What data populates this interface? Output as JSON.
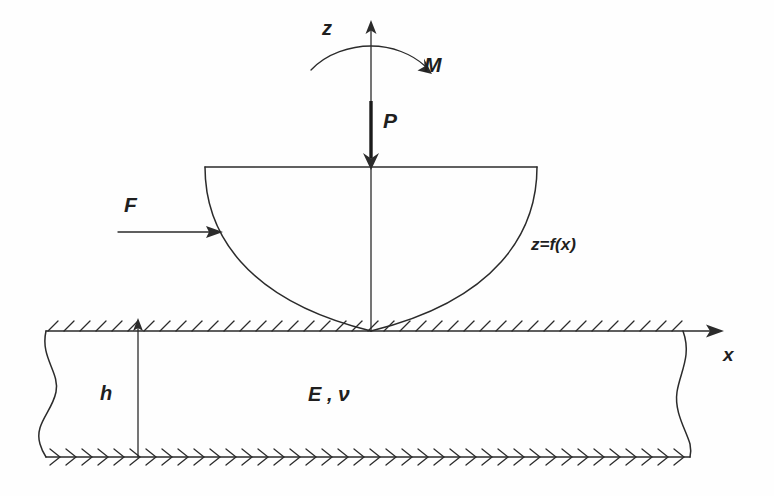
{
  "figure": {
    "background_color": "#fefefe",
    "line_color": "#2b2b2b",
    "labels": {
      "axis_z": "z",
      "axis_x": "x",
      "moment": "M",
      "normal_load": "P",
      "tangential_load": "F",
      "profile": "z=f(x)",
      "layer_thickness": "h",
      "material_properties_modulus": "E",
      "material_properties_separator": " , ",
      "material_properties_poisson": "ν"
    },
    "icons": {
      "z_axis_arrow": "arrow-up-icon",
      "x_axis_arrow": "arrow-right-icon",
      "moment_arc": "curved-arrow-icon",
      "load_arrow": "arrow-down-icon",
      "friction_arrow": "arrow-right-icon",
      "dimension_arrow": "dimension-arrow-icon",
      "top_hatching": "surface-hatch-icon",
      "bottom_hatching": "fixed-support-hatch-icon",
      "break_line_left": "break-line-icon",
      "break_line_right": "break-line-icon"
    },
    "geometry": {
      "origin_x": 371,
      "surface_y": 331,
      "layer_bottom_y": 457,
      "layer_thickness_px": 126,
      "indenter_top_y": 167,
      "indenter_left_x": 205,
      "indenter_right_x": 537,
      "indenter_contact_x": 371,
      "z_axis_top_y": 26,
      "x_axis_right_x": 713,
      "dimension_line_x": 138,
      "break_left_x": 46,
      "break_right_x": 683
    }
  }
}
